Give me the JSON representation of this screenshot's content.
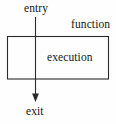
{
  "diagram": {
    "background_color": "#fefefe",
    "stroke_color": "#2b2b2b",
    "text_color": "#161616",
    "labels": {
      "entry": "entry",
      "function": "function",
      "execution": "execution",
      "exit": "exit"
    },
    "nodes": [
      {
        "id": "function-box",
        "label": "function",
        "shape": "rectangle",
        "x": 7,
        "y": 36,
        "width": 102,
        "height": 43,
        "inner_label": "execution"
      }
    ],
    "edges": [
      {
        "id": "entry-to-exit",
        "from": "entry",
        "to": "exit",
        "direction": "down",
        "arrowhead": "filled-triangle",
        "x": 35.5,
        "y_start": 17,
        "y_end": 102
      }
    ]
  }
}
